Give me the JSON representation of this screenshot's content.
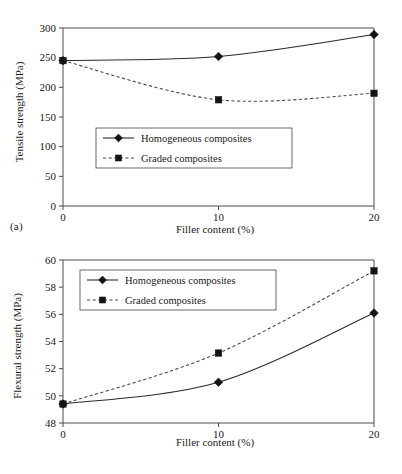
{
  "figure": {
    "panel_a_tag": "(a)",
    "panel_b_tag": "(b)"
  },
  "chart_data": [
    {
      "type": "line",
      "panel": "(a)",
      "title": "",
      "xlabel": "Filler content (%)",
      "ylabel": "Tensile strength (MPa)",
      "x": [
        0,
        10,
        20
      ],
      "xtick_labels": [
        "0",
        "10",
        "20"
      ],
      "ytick_labels": [
        "0",
        "50",
        "100",
        "150",
        "200",
        "250",
        "300"
      ],
      "yticks": [
        0,
        50,
        100,
        150,
        200,
        250,
        300
      ],
      "xlim": [
        0,
        20
      ],
      "ylim": [
        0,
        300
      ],
      "grid": false,
      "legend_position": "center-left",
      "series": [
        {
          "name": "Homogeneous composites",
          "values": [
            245,
            252,
            289
          ],
          "marker": "diamond",
          "line_style": "solid"
        },
        {
          "name": "Graded composites",
          "values": [
            245,
            179,
            190
          ],
          "marker": "square",
          "line_style": "dashed"
        }
      ]
    },
    {
      "type": "line",
      "panel": "(b)",
      "title": "",
      "xlabel": "Filler content (%)",
      "ylabel": "Flexural strength (MPa)",
      "x": [
        0,
        10,
        20
      ],
      "xtick_labels": [
        "0",
        "10",
        "20"
      ],
      "ytick_labels": [
        "48",
        "50",
        "52",
        "54",
        "56",
        "58",
        "60"
      ],
      "yticks": [
        48,
        50,
        52,
        54,
        56,
        58,
        60
      ],
      "xlim": [
        0,
        20
      ],
      "ylim": [
        48,
        60
      ],
      "grid": false,
      "legend_position": "upper-left",
      "series": [
        {
          "name": "Homogeneous composites",
          "values": [
            49.4,
            51.0,
            56.1
          ],
          "marker": "diamond",
          "line_style": "solid"
        },
        {
          "name": "Graded composites",
          "values": [
            49.4,
            53.15,
            59.2
          ],
          "marker": "square",
          "line_style": "dashed"
        }
      ]
    }
  ]
}
